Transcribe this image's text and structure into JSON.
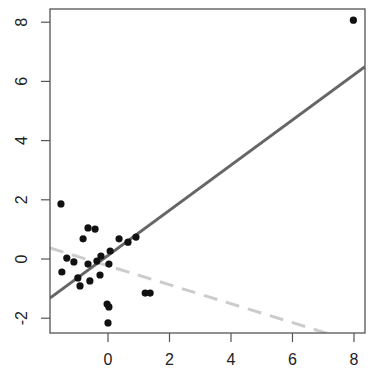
{
  "chart_data": {
    "type": "scatter",
    "title": "",
    "xlabel": "",
    "ylabel": "",
    "xlim": [
      -1.9,
      8.35
    ],
    "ylim": [
      -2.55,
      8.5
    ],
    "grid": false,
    "legend": null,
    "x_ticks": [
      0,
      2,
      4,
      6,
      8
    ],
    "y_ticks": [
      -2,
      0,
      2,
      4,
      6,
      8
    ],
    "x_tick_labels": [
      "0",
      "2",
      "4",
      "6",
      "8"
    ],
    "y_tick_labels": [
      "-2",
      "0",
      "2",
      "4",
      "6",
      "8"
    ],
    "series": [
      {
        "name": "points",
        "type": "scatter",
        "color": "#111111",
        "points": [
          [
            -1.53,
            1.86
          ],
          [
            -1.5,
            -0.44
          ],
          [
            -1.34,
            0.03
          ],
          [
            -1.11,
            -0.1
          ],
          [
            -0.98,
            -0.64
          ],
          [
            -0.91,
            -0.91
          ],
          [
            -0.81,
            0.68
          ],
          [
            -0.65,
            1.05
          ],
          [
            -0.42,
            1.01
          ],
          [
            -0.65,
            -0.17
          ],
          [
            -0.59,
            -0.74
          ],
          [
            -0.36,
            -0.07
          ],
          [
            -0.23,
            0.1
          ],
          [
            -0.26,
            -0.54
          ],
          [
            0.07,
            0.27
          ],
          [
            0.03,
            -0.17
          ],
          [
            0.36,
            0.68
          ],
          [
            0.65,
            0.57
          ],
          [
            0.91,
            0.74
          ],
          [
            -0.03,
            -1.52
          ],
          [
            0.03,
            -1.62
          ],
          [
            0.0,
            -2.16
          ],
          [
            1.21,
            -1.15
          ],
          [
            1.37,
            -1.15
          ],
          [
            7.98,
            8.07
          ]
        ]
      },
      {
        "name": "fit-solid",
        "type": "line",
        "style": "solid",
        "color": "#666666",
        "slope": 0.763,
        "intercept": 0.12
      },
      {
        "name": "fit-dashed",
        "type": "line",
        "style": "dashed",
        "color": "#cccccc",
        "slope": -0.32,
        "intercept": -0.23
      }
    ]
  }
}
